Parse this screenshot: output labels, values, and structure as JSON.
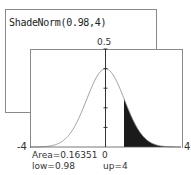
{
  "command_window": {
    "command": "ShadeNorm(0.98,4)"
  },
  "graph": {
    "y_top_label": "0.5",
    "x_min_label": "-4",
    "x_max_label": "4",
    "x_zero_label": "0",
    "area_text": "Area=0.16351",
    "low_text": "low=0.98",
    "up_text": "up=4"
  },
  "chart_data": {
    "type": "area",
    "title": "ShadeNorm(0.98,4)",
    "distribution": "standard normal",
    "xlim": [
      -4,
      4
    ],
    "ylim": [
      0,
      0.5
    ],
    "shade_low": 0.98,
    "shade_up": 4,
    "area": 0.16351,
    "y_ticks": [
      0.1,
      0.2,
      0.3,
      0.4,
      0.5
    ],
    "colors": {
      "curve": "#888888",
      "shade": "#1a1a1a",
      "axis": "#333333"
    }
  }
}
